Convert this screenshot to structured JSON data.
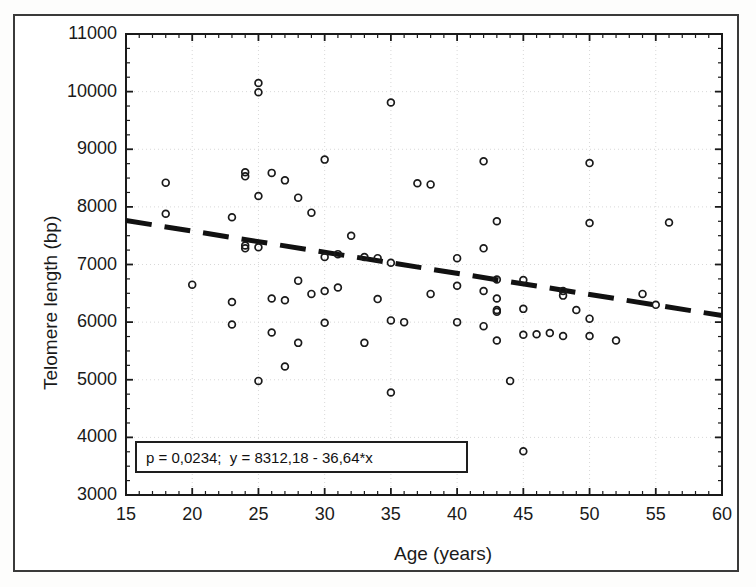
{
  "figure": {
    "background_color": "#ffffff",
    "frame_color": "#3a3a3a"
  },
  "axes": {
    "x_title": "Age (years)",
    "y_title": "Telomere length (bp)",
    "x_ticks": [
      "15",
      "20",
      "25",
      "30",
      "35",
      "40",
      "45",
      "50",
      "55",
      "60"
    ],
    "y_ticks": [
      "3000",
      "4000",
      "5000",
      "6000",
      "7000",
      "8000",
      "9000",
      "10000",
      "11000"
    ]
  },
  "annotation": {
    "text": "p = 0,0234;  y = 8312,18 - 36,64*x"
  },
  "chart_data": {
    "type": "scatter",
    "title": "",
    "xlabel": "Age (years)",
    "ylabel": "Telomere length (bp)",
    "xlim": [
      15,
      60
    ],
    "ylim": [
      3000,
      11000
    ],
    "xticks": [
      15,
      20,
      25,
      30,
      35,
      40,
      45,
      50,
      55,
      60
    ],
    "yticks": [
      3000,
      4000,
      5000,
      6000,
      7000,
      8000,
      9000,
      10000,
      11000
    ],
    "x_minor_tick_interval": 1,
    "y_minor_tick_interval": 250,
    "grid": true,
    "grid_style": "dotted",
    "grid_color": "#d8d8d8",
    "legend": false,
    "marker": {
      "shape": "circle-open",
      "color": "#1a1a1a",
      "size": 7
    },
    "series": [
      {
        "name": "Subjects",
        "x": [
          18,
          18,
          20,
          23,
          23,
          23,
          24,
          24,
          24,
          24,
          25,
          25,
          25,
          25,
          25,
          26,
          26,
          26,
          27,
          27,
          27,
          28,
          28,
          28,
          29,
          29,
          30,
          30,
          30,
          30,
          31,
          31,
          32,
          33,
          33,
          34,
          34,
          35,
          35,
          35,
          35,
          36,
          37,
          38,
          38,
          40,
          40,
          40,
          42,
          42,
          42,
          42,
          43,
          43,
          43,
          43,
          43,
          43,
          44,
          45,
          45,
          45,
          45,
          46,
          47,
          48,
          48,
          48,
          49,
          50,
          50,
          50,
          50,
          52,
          54,
          55,
          56
        ],
        "y": [
          8420,
          7880,
          6650,
          7820,
          6350,
          5960,
          8600,
          8530,
          7330,
          7280,
          10150,
          9990,
          8190,
          7300,
          4980,
          8590,
          6410,
          5820,
          8460,
          6380,
          5230,
          8160,
          6720,
          5640,
          7900,
          6490,
          8820,
          7130,
          6540,
          5990,
          7180,
          6600,
          7500,
          7130,
          5640,
          7110,
          6400,
          9810,
          7030,
          6030,
          4780,
          6000,
          8410,
          8390,
          6490,
          7110,
          6630,
          6000,
          8790,
          7280,
          6540,
          5930,
          7750,
          6740,
          6410,
          6210,
          6180,
          5680,
          4980,
          6730,
          6230,
          5780,
          3760,
          5790,
          5810,
          6540,
          6460,
          5760,
          6210,
          8760,
          7720,
          6060,
          5760,
          5680,
          6490,
          6300,
          7730
        ]
      }
    ],
    "fit_line": {
      "type": "linear-dashed",
      "equation": "y = 8312,18 - 36,64*x",
      "intercept": 8312.18,
      "slope": -36.64,
      "p_value": "0,0234",
      "x_start": 15,
      "x_end": 60,
      "color": "#111111",
      "dash_pattern": "long-dash"
    }
  }
}
